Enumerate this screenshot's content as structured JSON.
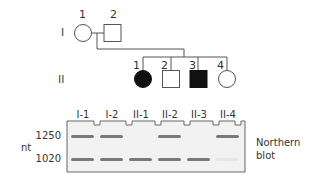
{
  "pedigree": {
    "generations": [
      {
        "label": "I",
        "members": [
          {
            "number": "1",
            "sex": "female",
            "affected": false
          },
          {
            "number": "2",
            "sex": "male",
            "affected": false
          }
        ]
      },
      {
        "label": "II",
        "members": [
          {
            "number": "1",
            "sex": "female",
            "affected": true
          },
          {
            "number": "2",
            "sex": "male",
            "affected": false
          },
          {
            "number": "3",
            "sex": "male",
            "affected": true
          },
          {
            "number": "4",
            "sex": "female",
            "affected": false
          }
        ]
      }
    ]
  },
  "blot": {
    "lanes": [
      "I-1",
      "I-2",
      "II-1",
      "II-2",
      "II-3",
      "II-4"
    ],
    "sizes": [
      "1250",
      "1020"
    ],
    "unit": "nt",
    "caption_line1": "Northern",
    "caption_line2": "blot",
    "bands": {
      "1250": [
        true,
        true,
        false,
        true,
        false,
        true
      ],
      "1020": [
        true,
        true,
        true,
        true,
        true,
        false
      ]
    }
  },
  "colors": {
    "line": "#555555",
    "fill": "#111111",
    "band": "#777777",
    "gel": "#f1f1f1"
  }
}
